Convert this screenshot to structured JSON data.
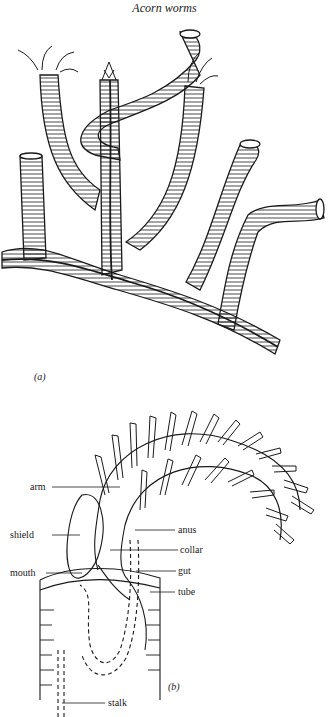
{
  "page": {
    "title": "Acorn worms"
  },
  "figure_a": {
    "label": "(a)",
    "subject": "colony of tube-dwelling pterobranch hemichordates (tubes with ringed/herringbone pattern, tentacle crowns emerging)"
  },
  "figure_b": {
    "label": "(b)",
    "labels": {
      "arm": "arm",
      "shield": "shield",
      "mouth": "mouth",
      "anus": "anus",
      "collar": "collar",
      "gut": "gut",
      "tube": "tube",
      "stalk": "stalk"
    }
  },
  "colors": {
    "ink": "#1a1a1a",
    "paper": "#ffffff"
  }
}
